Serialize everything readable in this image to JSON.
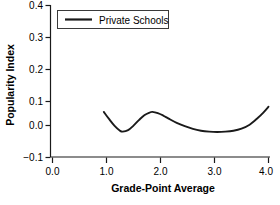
{
  "chart_data": {
    "type": "line",
    "title": "",
    "xlabel": "Grade-Point Average",
    "ylabel": "Popularity Index",
    "xlim": [
      0.0,
      4.0
    ],
    "ylim": [
      -0.1,
      0.4
    ],
    "grid": false,
    "legend_position": "upper-left",
    "xticks": [
      "0.0",
      "1.0",
      "2.0",
      "3.0",
      "4.0"
    ],
    "xtick_values": [
      0.0,
      1.0,
      2.0,
      3.0,
      4.0
    ],
    "yticks": [
      "0.4",
      "0.3",
      "0.2",
      "0.1",
      "0.0",
      "−0.1"
    ],
    "ytick_values": [
      0.4,
      0.3,
      0.2,
      0.1,
      0.0,
      -0.1
    ],
    "series": [
      {
        "name": "Private Schools",
        "color": "#1a1a1a",
        "x": [
          0.95,
          1.05,
          1.15,
          1.25,
          1.3,
          1.4,
          1.5,
          1.6,
          1.7,
          1.8,
          1.85,
          1.95,
          2.05,
          2.15,
          2.3,
          2.45,
          2.6,
          2.75,
          2.9,
          3.05,
          3.2,
          3.35,
          3.5,
          3.65,
          3.8,
          3.9,
          4.0
        ],
        "y": [
          0.05,
          0.026,
          0.004,
          -0.012,
          -0.015,
          -0.01,
          0.005,
          0.023,
          0.039,
          0.048,
          0.05,
          0.046,
          0.038,
          0.028,
          0.014,
          0.003,
          -0.006,
          -0.012,
          -0.015,
          -0.016,
          -0.015,
          -0.012,
          -0.005,
          0.008,
          0.03,
          0.047,
          0.067
        ]
      }
    ]
  },
  "legend": {
    "entries": [
      {
        "label": "Private Schools"
      }
    ]
  },
  "axes": {
    "x_title": "Grade-Point Average",
    "y_title": "Popularity Index"
  }
}
